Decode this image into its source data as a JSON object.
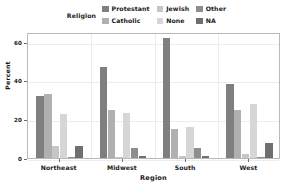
{
  "legend": {
    "title": "Religion",
    "entries": [
      {
        "label": "Protestant",
        "color": "#7f7f7f"
      },
      {
        "label": "Jewish",
        "color": "#c6c6c6"
      },
      {
        "label": "Other",
        "color": "#8e8e8e"
      },
      {
        "label": "Catholic",
        "color": "#b0b0b0"
      },
      {
        "label": "None",
        "color": "#d6d6d6"
      },
      {
        "label": "NA",
        "color": "#6f6f6f"
      }
    ]
  },
  "axes": {
    "y_label": "Percent",
    "y_ticks": [
      0,
      20,
      40,
      60
    ],
    "x_label": "Region",
    "x_ticks": [
      "Northeast",
      "Midwest",
      "South",
      "West"
    ]
  },
  "chart_data": {
    "type": "bar",
    "title": "",
    "xlabel": "Region",
    "ylabel": "Percent",
    "ylim": [
      0,
      65
    ],
    "yticks": [
      0,
      20,
      40,
      60
    ],
    "grid": true,
    "legend_title": "Religion",
    "legend_position": "top",
    "categories": [
      "Northeast",
      "Midwest",
      "South",
      "West"
    ],
    "series": [
      {
        "name": "Protestant",
        "color": "#7f7f7f",
        "values": [
          32,
          47,
          62,
          38
        ]
      },
      {
        "name": "Catholic",
        "color": "#b0b0b0",
        "values": [
          33,
          25,
          15,
          25
        ]
      },
      {
        "name": "Jewish",
        "color": "#c6c6c6",
        "values": [
          6,
          0.4,
          1,
          2
        ]
      },
      {
        "name": "None",
        "color": "#d6d6d6",
        "values": [
          22.5,
          23,
          16,
          28
        ]
      },
      {
        "name": "Other",
        "color": "#8e8e8e",
        "values": [
          0.3,
          5,
          5,
          0.3
        ]
      },
      {
        "name": "NA",
        "color": "#6f6f6f",
        "values": [
          6,
          1,
          1,
          8
        ]
      }
    ]
  }
}
